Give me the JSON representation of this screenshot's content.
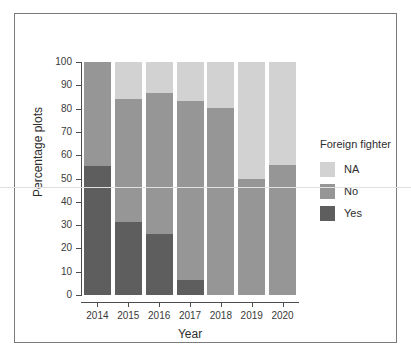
{
  "figure": {
    "frame_color": "#7b7b7b",
    "background": "#ffffff"
  },
  "chart_data": {
    "type": "bar",
    "stacked": true,
    "stack_mode": "percent",
    "title": "",
    "xlabel": "Year",
    "ylabel": "Percentage plots",
    "categories": [
      "2014",
      "2015",
      "2016",
      "2017",
      "2018",
      "2019",
      "2020"
    ],
    "ylim": [
      0,
      100
    ],
    "yticks": [
      0,
      10,
      20,
      30,
      40,
      50,
      60,
      70,
      80,
      90,
      100
    ],
    "ytick_labels": [
      "0",
      "10",
      "20",
      "30",
      "40",
      "50",
      "60",
      "70",
      "80",
      "90",
      "100"
    ],
    "grid": false,
    "legend_position": "right",
    "legend_title": "Foreign fighter",
    "series": [
      {
        "name": "Yes",
        "color": "#5e5e5e",
        "values": [
          55.4,
          31.3,
          26.2,
          6.4,
          0,
          0,
          0
        ]
      },
      {
        "name": "No",
        "color": "#969696",
        "values": [
          44.6,
          52.9,
          60.5,
          76.9,
          80.3,
          49.8,
          55.8
        ]
      },
      {
        "name": "NA",
        "color": "#d2d2d2",
        "values": [
          0,
          15.8,
          13.3,
          16.7,
          19.7,
          50.2,
          44.2
        ]
      }
    ],
    "cumulative_tops": {
      "Yes": [
        55.4,
        31.3,
        26.2,
        6.4,
        0,
        0,
        0
      ],
      "Yes+No": [
        100,
        84.2,
        86.7,
        83.3,
        80.3,
        49.8,
        55.8
      ],
      "Yes+No+NA": [
        100,
        100,
        100,
        100,
        100,
        100,
        100
      ]
    }
  },
  "legend": {
    "title": "Foreign fighter",
    "items": [
      {
        "label": "NA",
        "color": "#d2d2d2"
      },
      {
        "label": "No",
        "color": "#969696"
      },
      {
        "label": "Yes",
        "color": "#5e5e5e"
      }
    ]
  }
}
